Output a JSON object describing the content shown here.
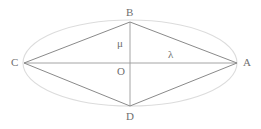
{
  "figure": {
    "type": "geometry-diagram",
    "background_color": "#ffffff",
    "ellipse_color": "#dcdcdc",
    "line_color": "#8a8a8a",
    "label_color": "#6f6f6f"
  },
  "geometry": {
    "center": {
      "x": 130,
      "y": 63,
      "label": "O"
    },
    "ellipse": {
      "cx": 130,
      "cy": 63,
      "rx": 107,
      "ry": 43
    },
    "vertices": [
      {
        "id": "A",
        "x": 237,
        "y": 63
      },
      {
        "id": "B",
        "x": 130,
        "y": 22
      },
      {
        "id": "C",
        "x": 24,
        "y": 63
      },
      {
        "id": "D",
        "x": 130,
        "y": 106
      }
    ],
    "edges": [
      {
        "from": "C",
        "to": "B"
      },
      {
        "from": "B",
        "to": "A"
      },
      {
        "from": "A",
        "to": "D"
      },
      {
        "from": "D",
        "to": "C"
      }
    ],
    "axes": [
      {
        "id": "horizontal-axis",
        "from": "C",
        "to": "A"
      },
      {
        "id": "vertical-axis",
        "from": "B",
        "to": "D"
      }
    ]
  },
  "labels": {
    "vertex_a": "A",
    "vertex_b": "B",
    "vertex_c": "C",
    "vertex_d": "D",
    "origin": "O",
    "semi_minor": "μ",
    "semi_major": "λ"
  }
}
